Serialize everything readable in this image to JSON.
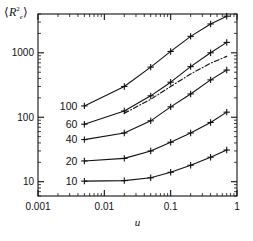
{
  "figure": {
    "background": "#ffffff",
    "frame_color": "#111111",
    "ylabel_text": "R",
    "ylabel_sup": "2",
    "ylabel_sub": "e",
    "ylabel_open": "⟨",
    "ylabel_close": "⟩"
  },
  "chart_data": {
    "type": "line",
    "title": "",
    "xlabel": "u",
    "ylabel": "⟨R²e⟩",
    "xscale": "log",
    "yscale": "log",
    "xlim": [
      0.001,
      1
    ],
    "ylim": [
      6,
      4000
    ],
    "grid": false,
    "legend": "inline-left-labels",
    "xticks": [
      0.001,
      0.01,
      0.1,
      1
    ],
    "xticklabels": [
      "0.001",
      "0.01",
      "0.1",
      "1"
    ],
    "yticks": [
      10,
      100,
      1000
    ],
    "yticklabels": [
      "10",
      "100",
      "1000"
    ],
    "marker": "plus",
    "x": [
      0.005,
      0.02,
      0.05,
      0.1,
      0.2,
      0.4,
      0.7
    ],
    "series": [
      {
        "name": "100",
        "label": "100",
        "label_value": 100,
        "values": [
          150,
          300,
          600,
          1050,
          1800,
          2800,
          3700
        ],
        "style": "solid"
      },
      {
        "name": "60",
        "label": "60",
        "label_value": 60,
        "values": [
          78,
          125,
          215,
          350,
          610,
          1000,
          1450
        ],
        "style": "solid"
      },
      {
        "name": "40",
        "label": "40",
        "label_value": 40,
        "values": [
          45,
          57,
          88,
          145,
          230,
          380,
          540
        ],
        "style": "solid"
      },
      {
        "name": "20",
        "label": "20",
        "label_value": 20,
        "values": [
          21,
          23,
          30,
          41,
          57,
          83,
          120
        ],
        "style": "solid"
      },
      {
        "name": "10",
        "label": "10",
        "label_value": 10,
        "values": [
          10.2,
          10.4,
          11.5,
          14,
          18,
          24,
          31
        ],
        "style": "solid"
      },
      {
        "name": "reference",
        "label": "",
        "style": "dashdot",
        "x": [
          0.02,
          0.05,
          0.1,
          0.2,
          0.4,
          0.7
        ],
        "values": [
          115,
          190,
          300,
          470,
          690,
          880
        ]
      }
    ]
  }
}
